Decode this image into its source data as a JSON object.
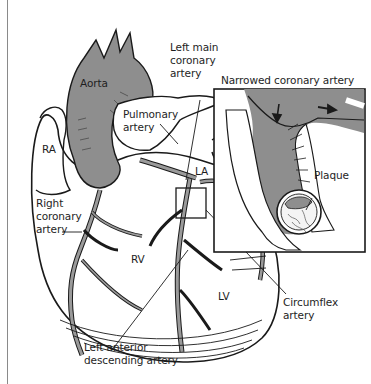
{
  "diagram": {
    "type": "anatomical-illustration",
    "colors": {
      "vessel_fill": "#8e8e8e",
      "outline": "#1a1a1a",
      "background": "#ffffff",
      "plaque_fill": "#9a9a9a"
    },
    "labels": {
      "aorta": "Aorta",
      "left_main_line1": "Left main",
      "left_main_line2": "coronary",
      "left_main_line3": "artery",
      "pulmonary_line1": "Pulmonary",
      "pulmonary_line2": "artery",
      "ra": "RA",
      "la": "LA",
      "rv": "RV",
      "lv": "LV",
      "right_coronary_line1": "Right",
      "right_coronary_line2": "coronary",
      "right_coronary_line3": "artery",
      "lad_line1": "Left anterior",
      "lad_line2": "descending artery",
      "circumflex_line1": "Circumflex",
      "circumflex_line2": "artery",
      "inset_title": "Narrowed coronary artery",
      "plaque": "Plaque"
    },
    "nodes": [
      {
        "id": "aorta",
        "label": "Aorta"
      },
      {
        "id": "pulmonary-artery",
        "label": "Pulmonary artery"
      },
      {
        "id": "left-main-coronary-artery",
        "label": "Left main coronary artery"
      },
      {
        "id": "ra",
        "label": "RA"
      },
      {
        "id": "la",
        "label": "LA"
      },
      {
        "id": "rv",
        "label": "RV"
      },
      {
        "id": "lv",
        "label": "LV"
      },
      {
        "id": "right-coronary-artery",
        "label": "Right coronary artery"
      },
      {
        "id": "lad",
        "label": "Left anterior descending artery"
      },
      {
        "id": "circumflex",
        "label": "Circumflex artery"
      },
      {
        "id": "inset",
        "label": "Narrowed coronary artery"
      },
      {
        "id": "plaque",
        "label": "Plaque"
      }
    ],
    "edges": [
      {
        "from": "inset",
        "to": "left-main-coronary-artery",
        "kind": "magnification-callout"
      }
    ]
  }
}
